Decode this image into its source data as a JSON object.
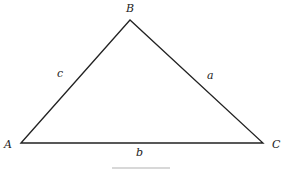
{
  "diagram": {
    "type": "triangle",
    "vertices": [
      {
        "name": "A",
        "x": 21,
        "y": 143
      },
      {
        "name": "B",
        "x": 130,
        "y": 20
      },
      {
        "name": "C",
        "x": 263,
        "y": 143
      }
    ],
    "sides": [
      {
        "name": "c",
        "between": [
          "A",
          "B"
        ]
      },
      {
        "name": "a",
        "between": [
          "B",
          "C"
        ]
      },
      {
        "name": "b",
        "between": [
          "A",
          "C"
        ]
      }
    ],
    "labels": {
      "A": "A",
      "B": "B",
      "C": "C",
      "a": "a",
      "b": "b",
      "c": "c"
    },
    "line_color": "#222222",
    "caption_clipped": true
  }
}
